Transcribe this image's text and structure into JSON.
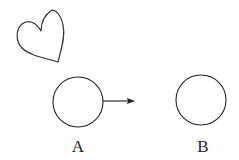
{
  "diagram": {
    "heart": {
      "shape": "heart",
      "stroke": "#333333"
    },
    "nodes": [
      {
        "id": "A",
        "label": "A",
        "cx": 78,
        "cy": 102,
        "r": 25
      },
      {
        "id": "B",
        "label": "B",
        "cx": 201,
        "cy": 100,
        "r": 25
      }
    ],
    "arrow": {
      "from": "A",
      "direction": "right",
      "x1": 103,
      "y1": 101,
      "x2": 135,
      "y2": 101
    }
  }
}
